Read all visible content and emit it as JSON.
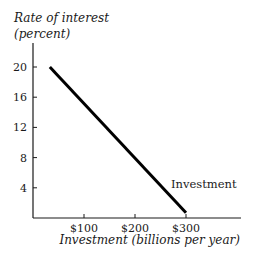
{
  "chart_data": {
    "type": "line",
    "title": "",
    "ylabel_line1": "Rate of interest",
    "ylabel_line2": "(percent)",
    "xlabel": "Investment (billions per year)",
    "x_ticks": [
      {
        "value": 100,
        "label": "$100"
      },
      {
        "value": 200,
        "label": "$200"
      },
      {
        "value": 300,
        "label": "$300"
      }
    ],
    "y_ticks": [
      {
        "value": 4,
        "label": "4"
      },
      {
        "value": 8,
        "label": "8"
      },
      {
        "value": 12,
        "label": "12"
      },
      {
        "value": 16,
        "label": "16"
      },
      {
        "value": 20,
        "label": "20"
      }
    ],
    "xlim": [
      0,
      350
    ],
    "ylim": [
      0,
      23
    ],
    "grid": false,
    "legend": "none",
    "series": [
      {
        "name": "Investment",
        "label": "Investment",
        "color": "#000000",
        "points": [
          {
            "x": 33,
            "y": 20
          },
          {
            "x": 300,
            "y": 0.7
          }
        ]
      }
    ]
  }
}
